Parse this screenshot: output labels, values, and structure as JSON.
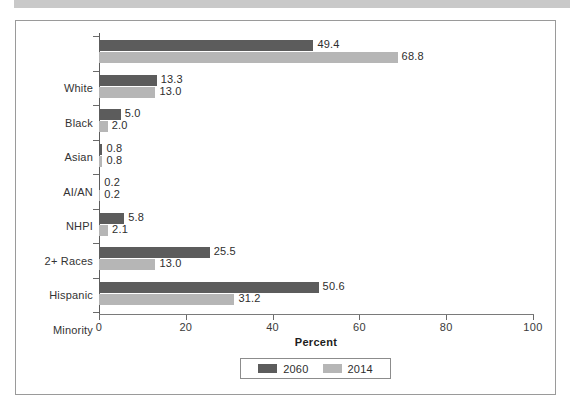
{
  "figure": {
    "border_color": "#9a9a9a",
    "background": "#ffffff"
  },
  "top_band": {
    "color": "#c9c9c9"
  },
  "chart_data": {
    "type": "bar",
    "orientation": "horizontal",
    "title": "",
    "xlabel": "Percent",
    "ylabel": "",
    "xlim": [
      0,
      100
    ],
    "xticks": [
      0,
      20,
      40,
      60,
      80,
      100
    ],
    "xtick_labels": [
      "0",
      "20",
      "40",
      "60",
      "80",
      "100"
    ],
    "grid": false,
    "legend_position": "bottom-center",
    "categories": [
      "White",
      "Black",
      "Asian",
      "AI/AN",
      "NHPI",
      "2+ Races",
      "Hispanic",
      "Minority"
    ],
    "series": [
      {
        "name": "2060",
        "color": "#5c5c5c",
        "values": [
          49.4,
          13.3,
          5.0,
          0.8,
          0.2,
          5.8,
          25.5,
          50.6
        ],
        "labels": [
          "49.4",
          "13.3",
          "5.0",
          "0.8",
          "0.2",
          "5.8",
          "25.5",
          "50.6"
        ]
      },
      {
        "name": "2014",
        "color": "#b6b6b6",
        "values": [
          68.8,
          13.0,
          2.0,
          0.8,
          0.2,
          2.1,
          13.0,
          31.2
        ],
        "labels": [
          "68.8",
          "13.0",
          "2.0",
          "0.8",
          "0.2",
          "2.1",
          "13.0",
          "31.2"
        ]
      }
    ]
  },
  "legend": {
    "items": [
      {
        "label": "2060",
        "color": "#5c5c5c"
      },
      {
        "label": "2014",
        "color": "#b6b6b6"
      }
    ]
  }
}
